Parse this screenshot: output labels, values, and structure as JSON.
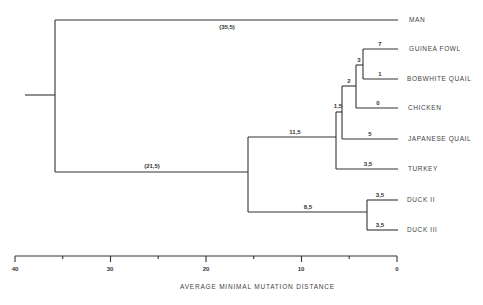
{
  "tree": {
    "taxa": [
      {
        "id": "man",
        "label": "MAN"
      },
      {
        "id": "guinea_fowl",
        "label": "GUINEA FOWL"
      },
      {
        "id": "bobwhite_quail",
        "label": "BOBWHITE QUAIL"
      },
      {
        "id": "chicken",
        "label": "CHICKEN"
      },
      {
        "id": "japanese_quail",
        "label": "JAPANESE QUAIL"
      },
      {
        "id": "turkey",
        "label": "TURKEY"
      },
      {
        "id": "duck_ii",
        "label": "DUCK II"
      },
      {
        "id": "duck_iii",
        "label": "DUCK III"
      }
    ],
    "branch_lengths": {
      "man": "(35,5)",
      "birds_root": "(21,5)",
      "galliform": "11,5",
      "ducks": "8,5",
      "node_1_5": "1,5",
      "node_2": "2",
      "node_3": "3",
      "guinea_fowl": "7",
      "bobwhite_quail": "1",
      "chicken": "0",
      "japanese_quail": "5",
      "turkey": "3,5",
      "duck_ii": "3,5",
      "duck_iii": "3,5"
    }
  },
  "axis": {
    "title": "AVERAGE MINIMAL MUTATION DISTANCE",
    "ticks": [
      "40",
      "30",
      "20",
      "10",
      "0"
    ]
  }
}
